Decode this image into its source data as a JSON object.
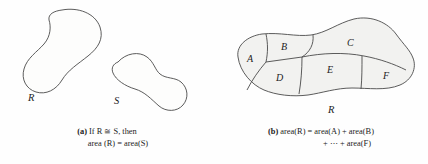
{
  "figure": {
    "background_color": "#fefefe",
    "line_color": "#4a4a4a",
    "region_fill_color": "#f2f2f0",
    "text_color": "#1c1c1c"
  },
  "panel_a": {
    "name": "congruent-regions",
    "shapes": [
      {
        "id": "R",
        "label": "R"
      },
      {
        "id": "S",
        "label": "S"
      }
    ],
    "caption": {
      "tag": "(a)",
      "line1": "If R ≅ S, then",
      "line2": "area (R) = area(S)"
    }
  },
  "panel_b": {
    "name": "partitioned-region",
    "outer_label": "R",
    "regions": [
      {
        "id": "A",
        "label": "A"
      },
      {
        "id": "B",
        "label": "B"
      },
      {
        "id": "C",
        "label": "C"
      },
      {
        "id": "D",
        "label": "D"
      },
      {
        "id": "E",
        "label": "E"
      },
      {
        "id": "F",
        "label": "F"
      }
    ],
    "caption": {
      "tag": "(b)",
      "line1": "area(R) = area(A) + area(B)",
      "line2": "+ ⋯ + area(F)"
    }
  }
}
